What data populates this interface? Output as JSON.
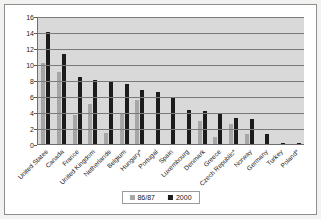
{
  "chart_data": {
    "type": "bar",
    "title": "",
    "xlabel": "",
    "ylabel": "",
    "ylim": [
      0,
      16
    ],
    "ytick_step": 2,
    "yticks": [
      16,
      14,
      12,
      10,
      8,
      6,
      4,
      2,
      0
    ],
    "grid": true,
    "legend_position": "bottom",
    "categories": [
      "United States",
      "Canada",
      "France",
      "United Kingdom",
      "Netherlands",
      "Belgium",
      "Hungary*",
      "Portugal",
      "Spain",
      "Luxembourg",
      "Denmark",
      "Greece",
      "Czech Republic*",
      "Norway",
      "Germany",
      "Turkey",
      "Poland*"
    ],
    "series": [
      {
        "name": "86/87",
        "color": "#a6a6a6",
        "values": [
          10.1,
          9.0,
          3.6,
          5.0,
          1.4,
          3.8,
          5.5,
          null,
          null,
          null,
          2.9,
          0.9,
          2.5,
          1.2,
          null,
          null,
          null
        ]
      },
      {
        "name": "2000",
        "color": "#1c1c1c",
        "values": [
          14.0,
          11.3,
          8.4,
          8.0,
          7.9,
          7.5,
          6.7,
          6.5,
          5.7,
          4.2,
          4.1,
          3.7,
          3.2,
          3.1,
          1.3,
          0.1,
          0.1
        ]
      }
    ]
  }
}
